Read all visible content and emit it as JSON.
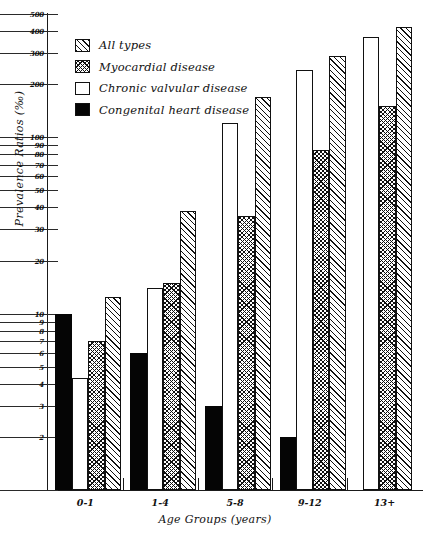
{
  "chart_data": {
    "type": "bar",
    "title": "",
    "xlabel": "Age Groups (years)",
    "ylabel": "Prevalence Ratios (‰)",
    "yscale": "log",
    "ylim": [
      1,
      500
    ],
    "grid": false,
    "legend_position": "upper-left",
    "categories": [
      "0-1",
      "1-4",
      "5-8",
      "9-12",
      "13+"
    ],
    "y_ticks": [
      1,
      2,
      3,
      4,
      5,
      6,
      7,
      8,
      9,
      10,
      20,
      30,
      40,
      50,
      60,
      70,
      80,
      90,
      100,
      200,
      300,
      400,
      500
    ],
    "y_tick_labels": [
      "1",
      "2",
      "3",
      "4",
      "5",
      "6",
      "7",
      "8",
      "9",
      "10",
      "20",
      "30",
      "40",
      "50",
      "60",
      "70",
      "80",
      "90",
      "100",
      "200",
      "300",
      "400",
      "500"
    ],
    "series": [
      {
        "name": "Congenital heart disease",
        "fill": "solid",
        "values": [
          10.0,
          6.0,
          3.0,
          2.0,
          null
        ]
      },
      {
        "name": "Chronic valvular disease",
        "fill": "white",
        "values": [
          4.3,
          14.0,
          120.0,
          240.0,
          370.0
        ]
      },
      {
        "name": "Myocardial disease",
        "fill": "cross-hatch",
        "values": [
          7.0,
          15.0,
          36.0,
          85.0,
          150.0
        ]
      },
      {
        "name": "All types",
        "fill": "diagonal-hatch",
        "values": [
          12.5,
          38.0,
          170.0,
          290.0,
          420.0
        ]
      }
    ]
  },
  "legend": {
    "items": [
      {
        "label": "All types",
        "fill": "diagonal-hatch"
      },
      {
        "label": "Myocardial disease",
        "fill": "cross-hatch"
      },
      {
        "label": "Chronic valvular disease",
        "fill": "white"
      },
      {
        "label": "Congenital heart disease",
        "fill": "solid"
      }
    ]
  },
  "colors": {
    "ink": "#111111",
    "background": "#ffffff"
  }
}
